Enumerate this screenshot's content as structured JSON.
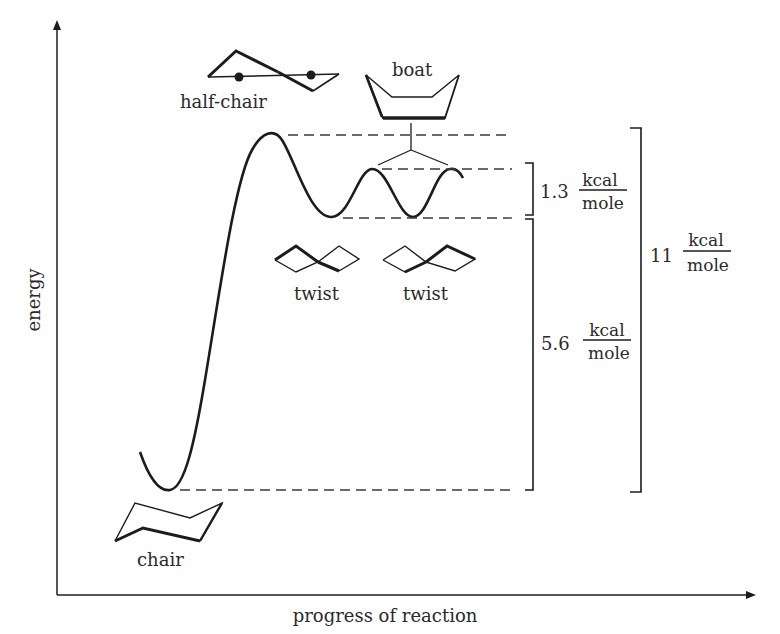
{
  "diagram": {
    "axes": {
      "y_label": "energy",
      "x_label": "progress of reaction"
    },
    "conformations": [
      {
        "id": "chair",
        "label": "chair"
      },
      {
        "id": "half_chair",
        "label": "half-chair"
      },
      {
        "id": "twist_1",
        "label": "twist"
      },
      {
        "id": "boat",
        "label": "boat"
      },
      {
        "id": "twist_2",
        "label": "twist"
      }
    ],
    "energy_gaps": [
      {
        "id": "boat_twist",
        "value": "1.3",
        "unit_num": "kcal",
        "unit_den": "mole"
      },
      {
        "id": "twist_chair",
        "value": "5.6",
        "unit_num": "kcal",
        "unit_den": "mole"
      },
      {
        "id": "halfchair_chair",
        "value": "11",
        "unit_num": "kcal",
        "unit_den": "mole"
      }
    ]
  },
  "colors": {
    "ink": "#1c1c1c",
    "background": "#ffffff"
  }
}
